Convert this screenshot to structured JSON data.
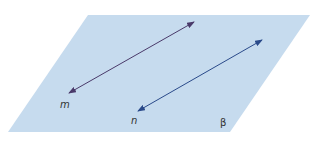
{
  "diagram": {
    "plane": {
      "label": "β",
      "fill": "#c6dbee",
      "points": [
        [
          88,
          15
        ],
        [
          310,
          15
        ],
        [
          230,
          132
        ],
        [
          8,
          132
        ]
      ]
    },
    "lines": [
      {
        "name": "m",
        "label": "m",
        "color": "#4a3a6a",
        "x1": 69,
        "y1": 93,
        "x2": 194,
        "y2": 22,
        "label_pos": [
          60,
          108
        ]
      },
      {
        "name": "n",
        "label": "n",
        "color": "#2a4a8a",
        "x1": 138,
        "y1": 111,
        "x2": 262,
        "y2": 40,
        "label_pos": [
          131,
          124
        ]
      }
    ],
    "plane_label_pos": [
      220,
      126
    ]
  }
}
